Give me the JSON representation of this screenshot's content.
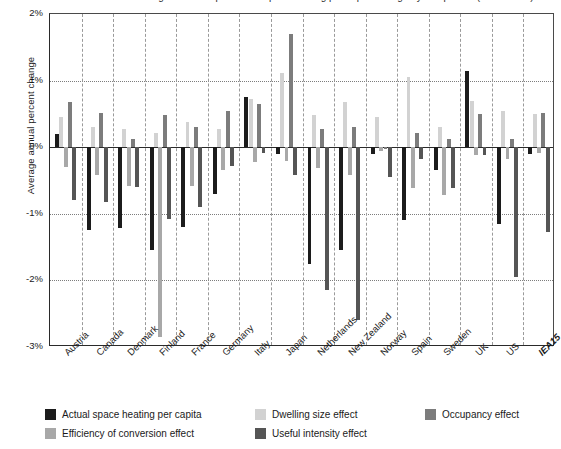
{
  "title_sliver": "Figure: Decomposition of space heating per capita change by component (1990–2005)",
  "axes": {
    "ylabel": "Average annual percent change",
    "yticks": [
      "2%",
      "1%",
      "0%",
      "-1%",
      "-2%",
      "-3%"
    ],
    "ytick_values": [
      2,
      1,
      0,
      -1,
      -2,
      -3
    ]
  },
  "legend": {
    "items": [
      {
        "label": "Actual space heating per capita",
        "color": "#1c1c1c"
      },
      {
        "label": "Dwelling size effect",
        "color": "#d2d2d2"
      },
      {
        "label": "Occupancy effect",
        "color": "#7c7c7c"
      },
      {
        "label": "Efficiency of conversion effect",
        "color": "#a8a8a8"
      },
      {
        "label": "Useful intensity effect",
        "color": "#555555"
      }
    ]
  },
  "chart_data": {
    "type": "bar",
    "title": "Decomposition of space heating per capita change by component",
    "xlabel": "",
    "ylabel": "Average annual percent change",
    "ylim": [
      -3,
      2
    ],
    "grid": true,
    "legend_position": "bottom",
    "categories": [
      "Austria",
      "Canada",
      "Denmark",
      "Finland",
      "France",
      "Germany",
      "Italy",
      "Japan",
      "Netherlands",
      "New Zealand",
      "Norway",
      "Spain",
      "Sweden",
      "UK",
      "US",
      "IEA15"
    ],
    "series": [
      {
        "name": "Actual space heating per capita",
        "color": "#1c1c1c",
        "values": [
          0.2,
          -1.25,
          -1.22,
          -1.55,
          -1.2,
          -0.7,
          0.75,
          -0.1,
          -1.75,
          -1.55,
          -0.1,
          -1.1,
          -0.35,
          1.15,
          -1.15,
          -0.1
        ]
      },
      {
        "name": "Dwelling size effect",
        "color": "#d2d2d2",
        "values": [
          0.45,
          0.3,
          0.28,
          0.22,
          0.38,
          0.28,
          0.72,
          1.12,
          0.48,
          0.68,
          0.45,
          1.05,
          0.3,
          0.7,
          0.55,
          0.5
        ]
      },
      {
        "name": "Efficiency of conversion effect",
        "color": "#a8a8a8",
        "values": [
          -0.3,
          -0.42,
          -0.58,
          -2.85,
          -0.58,
          -0.35,
          -0.22,
          -0.2,
          -0.32,
          -0.42,
          -0.05,
          -0.62,
          -0.72,
          -0.12,
          -0.18,
          -0.08
        ]
      },
      {
        "name": "Occupancy effect",
        "color": "#7c7c7c",
        "values": [
          0.68,
          0.52,
          0.12,
          0.48,
          0.3,
          0.55,
          0.65,
          1.7,
          0.28,
          0.3,
          -0.02,
          0.22,
          0.12,
          0.5,
          0.12,
          0.52
        ]
      },
      {
        "name": "Useful intensity effect",
        "color": "#555555",
        "values": [
          -0.8,
          -0.82,
          -0.6,
          -1.08,
          -0.9,
          -0.28,
          -0.08,
          -0.42,
          -2.15,
          -2.6,
          -0.45,
          -0.18,
          -0.62,
          -0.12,
          -1.95,
          -1.28
        ]
      }
    ]
  }
}
